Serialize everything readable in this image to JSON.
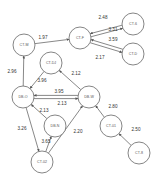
{
  "diagram": {
    "type": "directed-weighted-graph",
    "nodes": [
      {
        "id": "CT-M",
        "label": "CT-M",
        "x": 24,
        "y": 45,
        "r": 11
      },
      {
        "id": "CT-F",
        "label": "CT-F",
        "x": 80,
        "y": 38,
        "r": 11
      },
      {
        "id": "CT-6",
        "label": "CT-6",
        "x": 133,
        "y": 24,
        "r": 11
      },
      {
        "id": "CT-D",
        "label": "CT-D",
        "x": 133,
        "y": 54,
        "r": 11
      },
      {
        "id": "CT-DJ",
        "label": "CT-DJ",
        "x": 51,
        "y": 63,
        "r": 11
      },
      {
        "id": "DB-O",
        "label": "DB-O",
        "x": 23,
        "y": 97,
        "r": 11
      },
      {
        "id": "DB-W",
        "label": "DB-W",
        "x": 89,
        "y": 97,
        "r": 11
      },
      {
        "id": "DB-N",
        "label": "DB-N",
        "x": 55,
        "y": 126,
        "r": 11
      },
      {
        "id": "CT-02",
        "label": "CT-02",
        "x": 42,
        "y": 162,
        "r": 11
      },
      {
        "id": "CT-01",
        "label": "CT-01",
        "x": 111,
        "y": 126,
        "r": 11
      },
      {
        "id": "CT-8",
        "label": "CT-8",
        "x": 139,
        "y": 153,
        "r": 11
      }
    ],
    "edges": [
      {
        "from": "CT-M",
        "to": "CT-F",
        "weight": "1.97",
        "lx": 43,
        "ly": 38
      },
      {
        "from": "CT-6",
        "to": "CT-F",
        "weight": "2.48",
        "lx": 103,
        "ly": 18
      },
      {
        "from": "CT-F",
        "to": "CT-6",
        "weight": "3.31",
        "lx": 113,
        "ly": 30
      },
      {
        "from": "CT-F",
        "to": "CT-D",
        "weight": "3.59",
        "lx": 113,
        "ly": 40
      },
      {
        "from": "CT-D",
        "to": "CT-F",
        "weight": "2.17",
        "lx": 100,
        "ly": 58
      },
      {
        "from": "DB-O",
        "to": "CT-M",
        "weight": "2.96",
        "lx": 12,
        "ly": 72
      },
      {
        "from": "CT-DJ",
        "to": "DB-O",
        "weight": "3.96",
        "lx": 42,
        "ly": 81
      },
      {
        "from": "DB-W",
        "to": "CT-DJ",
        "weight": "2.12",
        "lx": 76,
        "ly": 74
      },
      {
        "from": "DB-W",
        "to": "DB-O",
        "weight": "3.95",
        "lx": 59,
        "ly": 92
      },
      {
        "from": "DB-O",
        "to": "DB-W",
        "weight": "2.13",
        "lx": 62,
        "ly": 104
      },
      {
        "from": "DB-N",
        "to": "DB-O",
        "weight": "2.13",
        "lx": 44,
        "ly": 111
      },
      {
        "from": "DB-O",
        "to": "CT-02",
        "weight": "3.26",
        "lx": 22,
        "ly": 129
      },
      {
        "from": "CT-02",
        "to": "DB-N",
        "weight": "3.65",
        "lx": 46,
        "ly": 142
      },
      {
        "from": "CT-02",
        "to": "DB-W",
        "weight": "2.20",
        "lx": 78,
        "ly": 132
      },
      {
        "from": "CT-01",
        "to": "DB-W",
        "weight": "2.80",
        "lx": 113,
        "ly": 107
      },
      {
        "from": "CT-8",
        "to": "CT-01",
        "weight": "2.50",
        "lx": 136,
        "ly": 130
      }
    ],
    "colors": {
      "node_stroke": "#666666",
      "edge_stroke": "#555555",
      "label_text": "#333333",
      "background": "#ffffff"
    }
  }
}
